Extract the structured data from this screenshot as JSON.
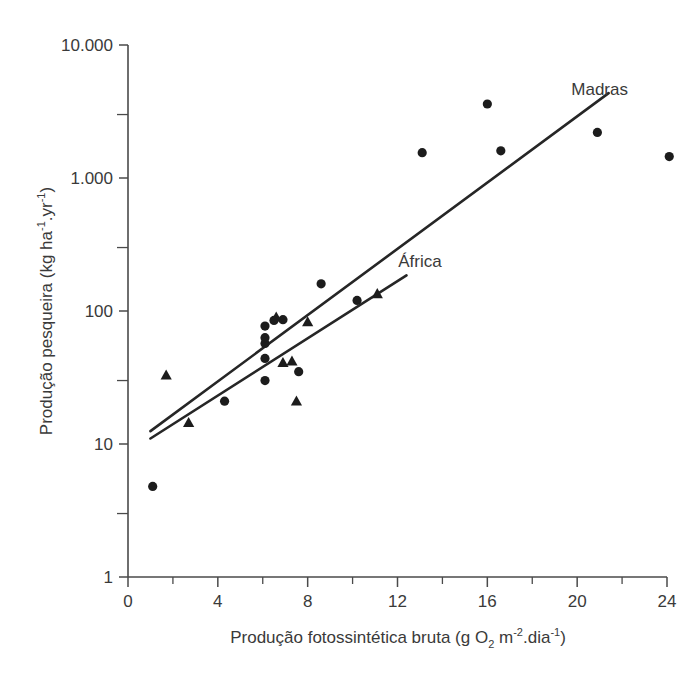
{
  "chart_data": {
    "type": "scatter",
    "title": "",
    "xlabel": "Produção fotossintética bruta (g O2 m-2.dia-1)",
    "ylabel": "Produção pesqueira (kg ha-1.yr-1)",
    "xlabel_parts": {
      "main": "Produção fotossintética bruta (g O",
      "sub_2": "2",
      "mid": " m",
      "sup_minus2": "-2",
      "mid2": ".dia",
      "sup_minus1": "-1",
      "tail": ")"
    },
    "ylabel_parts": {
      "main": "Produção pesqueira (kg ha",
      "sup_minus1_a": "-1",
      "mid": ".yr",
      "sup_minus1_b": "-1",
      "tail": ")"
    },
    "xlim": [
      0,
      24
    ],
    "ylim": [
      1,
      10000
    ],
    "yscale": "log",
    "xscale": "linear",
    "grid": false,
    "legend_position": "inline-annotation",
    "x_ticks_major": [
      0,
      4,
      8,
      12,
      16,
      20,
      24
    ],
    "x_tick_labels": [
      "0",
      "4",
      "8",
      "12",
      "16",
      "20",
      "24"
    ],
    "x_ticks_minor": [
      2,
      6,
      10,
      14,
      18,
      22
    ],
    "y_ticks_major": [
      1,
      10,
      100,
      1000,
      10000
    ],
    "y_tick_labels": [
      "1",
      "10",
      "100",
      "1.000",
      "10.000"
    ],
    "y_ticks_minor": [
      3,
      30,
      300,
      3000
    ],
    "series": [
      {
        "name": "circle-points",
        "marker": "circle",
        "color": "#1c1c1c",
        "points": [
          {
            "x": 1.1,
            "y": 4.8
          },
          {
            "x": 4.3,
            "y": 21
          },
          {
            "x": 6.1,
            "y": 30
          },
          {
            "x": 6.1,
            "y": 44
          },
          {
            "x": 6.1,
            "y": 57
          },
          {
            "x": 6.1,
            "y": 63
          },
          {
            "x": 6.1,
            "y": 77
          },
          {
            "x": 6.5,
            "y": 85
          },
          {
            "x": 6.9,
            "y": 86
          },
          {
            "x": 7.6,
            "y": 35
          },
          {
            "x": 8.6,
            "y": 160
          },
          {
            "x": 10.2,
            "y": 120
          },
          {
            "x": 13.1,
            "y": 1550
          },
          {
            "x": 16.0,
            "y": 3600
          },
          {
            "x": 16.6,
            "y": 1600
          },
          {
            "x": 20.9,
            "y": 2200
          },
          {
            "x": 24.1,
            "y": 1450
          }
        ]
      },
      {
        "name": "triangle-points",
        "marker": "triangle",
        "color": "#1c1c1c",
        "points": [
          {
            "x": 1.7,
            "y": 33
          },
          {
            "x": 2.7,
            "y": 14.5
          },
          {
            "x": 6.6,
            "y": 90
          },
          {
            "x": 6.9,
            "y": 41
          },
          {
            "x": 7.3,
            "y": 42
          },
          {
            "x": 7.5,
            "y": 21
          },
          {
            "x": 8.0,
            "y": 83
          },
          {
            "x": 11.1,
            "y": 135
          }
        ]
      }
    ],
    "trend_lines": [
      {
        "name": "Madras",
        "label": "Madras",
        "x_start": 1.0,
        "y_start": 12.5,
        "x_end": 21.4,
        "y_end": 4350,
        "label_x": 21.0,
        "label_y": 4200
      },
      {
        "name": "África",
        "label": "África",
        "x_start": 1.0,
        "y_start": 11.0,
        "x_end": 12.4,
        "y_end": 185,
        "label_x": 13.0,
        "label_y": 215
      }
    ],
    "annotations": [
      {
        "text": "Madras",
        "x": 21.0,
        "y": 4200
      },
      {
        "text": "África",
        "x": 13.0,
        "y": 215
      }
    ]
  },
  "figure": {
    "background_color": "#ffffff",
    "axis_color": "#4a4a4a",
    "marker_color": "#1c1c1c",
    "line_color": "#262626",
    "text_color": "#3a3a3a"
  }
}
